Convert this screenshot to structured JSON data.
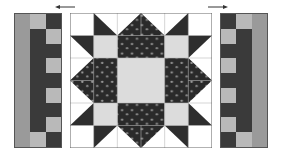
{
  "colors": {
    "background": "#ffffff",
    "dark": "#3a3a3a",
    "medium": "#9a9a9a",
    "light": "#b9b9b9",
    "pale": "#dcdcdc",
    "white": "#ffffff",
    "grid_line": "#b8b8b8",
    "print_dots": "#9c9c9c",
    "border": "#555555"
  },
  "arrows": {
    "left": {
      "direction": "left"
    },
    "right": {
      "direction": "right"
    }
  },
  "left_panel": {
    "columns": [
      [
        "medium",
        "medium",
        "medium",
        "medium",
        "medium",
        "medium",
        "medium",
        "medium",
        "medium"
      ],
      [
        "light",
        "dark",
        "dark",
        "dark",
        "dark",
        "dark",
        "dark",
        "dark",
        "light"
      ],
      [
        "dark",
        "light",
        "dark",
        "light",
        "dark",
        "light",
        "dark",
        "light",
        "dark"
      ]
    ]
  },
  "right_panel": {
    "columns": [
      [
        "dark",
        "light",
        "dark",
        "light",
        "dark",
        "light",
        "dark",
        "light",
        "dark"
      ],
      [
        "light",
        "dark",
        "dark",
        "dark",
        "dark",
        "dark",
        "dark",
        "dark",
        "light"
      ],
      [
        "medium",
        "medium",
        "medium",
        "medium",
        "medium",
        "medium",
        "medium",
        "medium",
        "medium"
      ]
    ]
  },
  "center_block": {
    "grid": 6,
    "description": "star quilt block"
  }
}
